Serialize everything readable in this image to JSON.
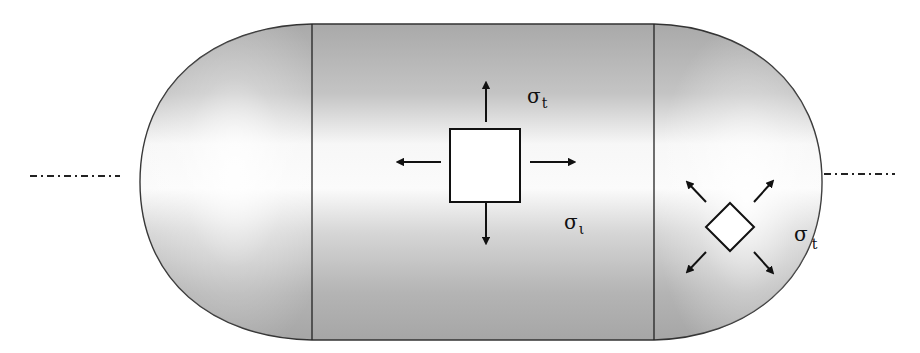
{
  "diagram": {
    "colors": {
      "background": "#ffffff",
      "vessel_fill_dark": "#a8a8a8",
      "vessel_fill_light": "#fbfbfb",
      "outline": "#222222",
      "element_fill": "#ffffff",
      "arrow": "#111111"
    },
    "labels": {
      "hoop_stress": {
        "symbol": "σ",
        "subscript": "t"
      },
      "longitudinal_stress": {
        "symbol": "σ",
        "subscript": "ι"
      },
      "head_stress": {
        "symbol": "σ",
        "subscript": "t"
      }
    },
    "elements": [
      {
        "name": "cylinder-stress-element",
        "shape": "square",
        "arrows": [
          "up",
          "down",
          "left",
          "right"
        ]
      },
      {
        "name": "head-stress-element",
        "shape": "diamond",
        "arrows": [
          "up-left",
          "up-right",
          "down-left",
          "down-right"
        ]
      }
    ],
    "centerline": {
      "style": "dash-dot"
    }
  }
}
